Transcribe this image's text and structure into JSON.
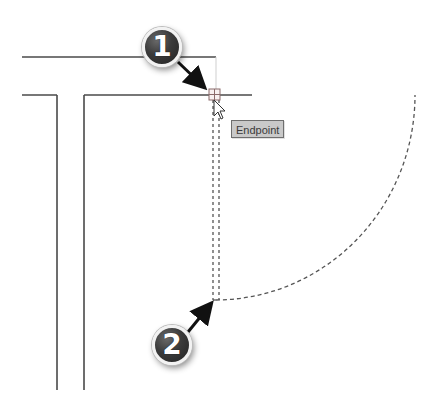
{
  "drawing": {
    "wall_lines": [
      {
        "x1": 22,
        "y1": 57,
        "x2": 216,
        "y2": 57
      },
      {
        "x1": 22,
        "y1": 95,
        "x2": 57,
        "y2": 95
      },
      {
        "x1": 57,
        "y1": 95,
        "x2": 57,
        "y2": 390
      },
      {
        "x1": 84,
        "y1": 95,
        "x2": 84,
        "y2": 390
      },
      {
        "x1": 84,
        "y1": 95,
        "x2": 252,
        "y2": 95
      }
    ],
    "door_swing_arc": {
      "cx": 216,
      "cy": 97,
      "r": 200
    },
    "door_panel_dashed": {
      "x_left": 213,
      "x_right": 219,
      "y_top": 100,
      "y_bottom": 300
    },
    "colors": {
      "line": "#4a4a4a",
      "dashed": "#555555",
      "badge": "#3b3b3b",
      "tooltip_bg": "#c9c9c9"
    }
  },
  "snap": {
    "marker": "endpoint-marker",
    "x": 209,
    "y": 89,
    "size": 11
  },
  "tooltip": {
    "label": "Endpoint"
  },
  "callouts": [
    {
      "number": "1"
    },
    {
      "number": "2"
    }
  ]
}
